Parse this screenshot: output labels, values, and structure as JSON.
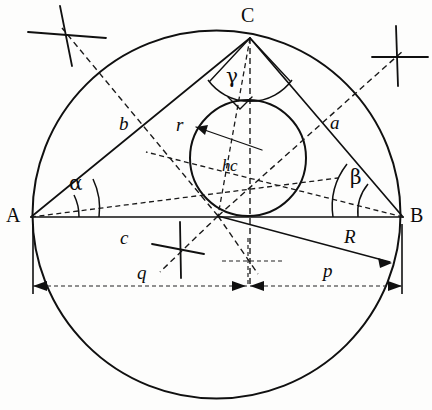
{
  "figure": {
    "type": "geometry-construction-diagram",
    "background_color": "#fdfdfc",
    "ink_color": "#101010"
  },
  "vertices": [
    {
      "id": "A",
      "label": "A",
      "x": 31,
      "y": 217
    },
    {
      "id": "B",
      "label": "B",
      "x": 403,
      "y": 217
    },
    {
      "id": "C",
      "label": "C",
      "x": 250,
      "y": 38
    }
  ],
  "vertex_labels": [
    {
      "name": "vertex-label-a",
      "text": "A",
      "left": 6,
      "top": 206
    },
    {
      "name": "vertex-label-b",
      "text": "B",
      "left": 410,
      "top": 206
    },
    {
      "name": "vertex-label-c",
      "text": "C",
      "left": 241,
      "top": 6
    }
  ],
  "side_labels": [
    {
      "name": "side-label-b",
      "text": "b",
      "left": 119,
      "top": 115
    },
    {
      "name": "side-label-a",
      "text": "a",
      "left": 330,
      "top": 114
    },
    {
      "name": "side-label-c",
      "text": "c",
      "left": 120,
      "top": 229
    }
  ],
  "angle_labels": [
    {
      "name": "angle-label-alpha",
      "text": "α",
      "left": 69,
      "top": 174
    },
    {
      "name": "angle-label-beta",
      "text": "β",
      "left": 350,
      "top": 168
    },
    {
      "name": "angle-label-gamma",
      "text": "γ",
      "left": 225,
      "top": 67
    }
  ],
  "measure_labels": [
    {
      "name": "radius-label-r",
      "text": "r",
      "left": 176,
      "top": 116
    },
    {
      "name": "altitude-label-hc",
      "text": "hc",
      "left": 222,
      "top": 158
    },
    {
      "name": "circumradius-label-R",
      "text": "R",
      "left": 344,
      "top": 228
    },
    {
      "name": "segment-label-q",
      "text": "q",
      "left": 137,
      "top": 264
    },
    {
      "name": "segment-label-p",
      "text": "p",
      "left": 323,
      "top": 262
    }
  ],
  "circumcircle": {
    "cx": 216.5,
    "cy": 214.5,
    "r": 184.0
  },
  "incircle": {
    "cx": 248,
    "cy": 158,
    "r": 58
  },
  "incircle_tangent_base": {
    "x": 218,
    "y": 216
  },
  "dimension_line": {
    "y": 286,
    "left_x": 33,
    "right_x": 402,
    "split_x": 248
  },
  "construction_marks": [
    {
      "name": "construction-cross-upper-left",
      "cx": 68,
      "cy": 35
    },
    {
      "name": "construction-cross-upper-right",
      "cx": 398,
      "cy": 57
    },
    {
      "name": "construction-cross-lower-left",
      "cx": 181,
      "cy": 249
    },
    {
      "name": "construction-cross-lower-center",
      "cx": 248,
      "cy": 261
    }
  ]
}
